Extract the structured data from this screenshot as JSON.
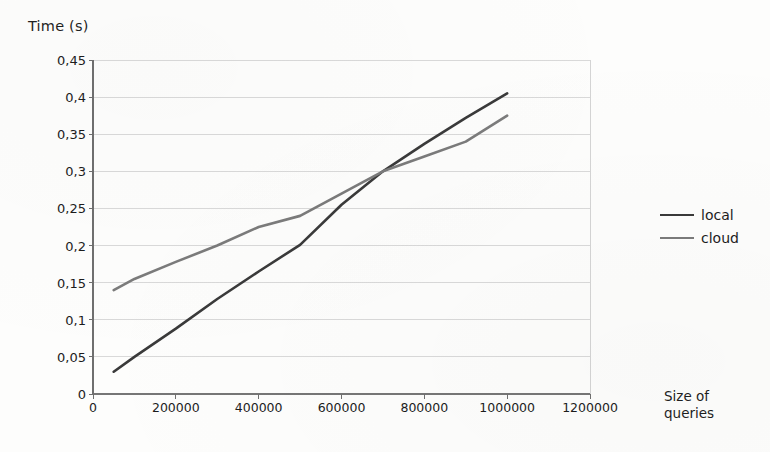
{
  "chart_data": {
    "type": "line",
    "title": "",
    "xlabel": "Size of queries",
    "ylabel": "Time (s)",
    "xlim": [
      0,
      1200000
    ],
    "ylim": [
      0,
      0.45
    ],
    "grid": true,
    "decimal_separator": ",",
    "legend_position": "right",
    "x_ticks": [
      0,
      200000,
      400000,
      600000,
      800000,
      1000000,
      1200000
    ],
    "x_tick_labels": [
      "0",
      "200000",
      "400000",
      "600000",
      "800000",
      "1000000",
      "1200000"
    ],
    "y_ticks": [
      0,
      0.05,
      0.1,
      0.15,
      0.2,
      0.25,
      0.3,
      0.35,
      0.4,
      0.45
    ],
    "y_tick_labels": [
      "0",
      "0,05",
      "0,1",
      "0,15",
      "0,2",
      "0,25",
      "0,3",
      "0,35",
      "0,4",
      "0,45"
    ],
    "x": [
      50000,
      100000,
      200000,
      300000,
      400000,
      500000,
      600000,
      700000,
      800000,
      900000,
      1000000
    ],
    "series": [
      {
        "name": "local",
        "color": "#3a3a3a",
        "values": [
          0.03,
          0.05,
          0.088,
          0.128,
          0.165,
          0.201,
          0.255,
          0.3,
          0.337,
          0.372,
          0.405
        ]
      },
      {
        "name": "cloud",
        "color": "#7b7b7b",
        "values": [
          0.14,
          0.155,
          0.178,
          0.2,
          0.225,
          0.24,
          0.27,
          0.3,
          0.32,
          0.34,
          0.375
        ]
      }
    ]
  },
  "axes": {
    "y_title": "Time (s)",
    "x_title_line1": "Size of",
    "x_title_line2": "queries"
  },
  "legend": {
    "entries": [
      {
        "label": "local",
        "color": "#3a3a3a"
      },
      {
        "label": "cloud",
        "color": "#7b7b7b"
      }
    ]
  },
  "plot_geometry": {
    "left": 93,
    "right": 590,
    "top": 60,
    "bottom": 394
  },
  "colors": {
    "grid": "#c9c9c9",
    "axis": "#6f6f6f",
    "text": "#1c1c1c",
    "background": "#fdfdfc"
  }
}
